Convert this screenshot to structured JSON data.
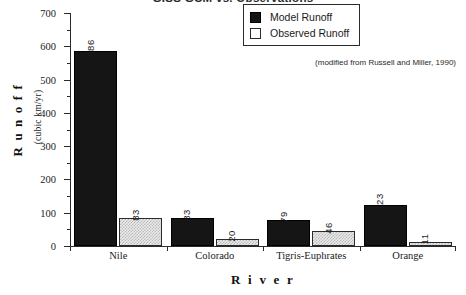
{
  "chart_data": {
    "type": "bar",
    "title": "GISS GCM vs. Observations",
    "xlabel": "R i v e r",
    "ylabel_main": "R u n o f f",
    "ylabel_sub": "(cubic  km/yr)",
    "categories": [
      "Nile",
      "Colorado",
      "Tigris-Euphrates",
      "Orange"
    ],
    "series": [
      {
        "name": "Model Runoff",
        "values": [
          586,
          83,
          79,
          123
        ],
        "color": "#151515"
      },
      {
        "name": "Observed Runoff",
        "values": [
          83,
          20,
          46,
          11
        ],
        "color": "#ebebeb"
      }
    ],
    "ylim": [
      0,
      700
    ],
    "ytick_labels": [
      "0",
      "100",
      "200",
      "300",
      "400",
      "500",
      "600",
      "700"
    ],
    "ytick_values": [
      0,
      100,
      200,
      300,
      400,
      500,
      600,
      700
    ],
    "yminor_values": [
      50,
      150,
      250,
      350,
      450,
      550,
      650
    ],
    "grid": false,
    "legend_position": "top-right",
    "annotation": "(modified from Russell and Miller, 1990)"
  },
  "legend": {
    "items": [
      {
        "label": "Model Runoff",
        "swatch": "filled-black-square"
      },
      {
        "label": "Observed Runoff",
        "swatch": "empty-white-square"
      }
    ]
  }
}
